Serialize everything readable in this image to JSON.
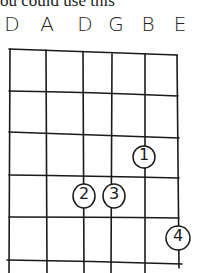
{
  "caption_fragment": "ou could use this",
  "tuning": [
    "D",
    "A",
    "D",
    "G",
    "B",
    "E"
  ],
  "chord": {
    "strings": 6,
    "frets_shown": 5,
    "fingers": [
      {
        "finger": "1",
        "string": 5,
        "fret": 3
      },
      {
        "finger": "2",
        "string": 3,
        "fret": 4
      },
      {
        "finger": "3",
        "string": 4,
        "fret": 4
      },
      {
        "finger": "4",
        "string": 6,
        "fret": 5
      }
    ]
  },
  "colors": {
    "ink": "#1a1a1a",
    "background": "#ffffff"
  }
}
